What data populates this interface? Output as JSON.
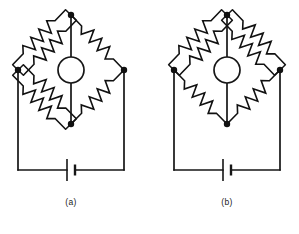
{
  "figure": {
    "kind": "circuit-diagram",
    "line_color": "#161616",
    "background_color": "#ffffff",
    "panel_count": 2
  },
  "panels": [
    {
      "id": "panel-a",
      "caption": "(a)",
      "caption_x": 71,
      "caption_y": 205,
      "origin_x": 0,
      "bridge": {
        "top_node": {
          "x": 71,
          "y": 15
        },
        "left_node": {
          "x": 18,
          "y": 70
        },
        "right_node": {
          "x": 124,
          "y": 70
        },
        "bottom_node": {
          "x": 71,
          "y": 124
        },
        "galvanometer": {
          "cx": 71,
          "cy": 70,
          "r": 13,
          "label": ""
        },
        "arms": [
          {
            "name": "upper-left",
            "resistor_count": 2
          },
          {
            "name": "upper-right",
            "resistor_count": 1
          },
          {
            "name": "lower-left",
            "resistor_count": 2
          },
          {
            "name": "lower-right",
            "resistor_count": 1
          }
        ]
      },
      "supply": {
        "rail_y": 170,
        "left_rail_x": 18,
        "right_rail_x": 124,
        "battery": {
          "x": 71,
          "y": 170,
          "long_plate_height": 22,
          "short_plate_height": 11
        }
      }
    },
    {
      "id": "panel-b",
      "caption": "(b)",
      "caption_x": 227,
      "caption_y": 205,
      "origin_x": 156,
      "bridge": {
        "top_node": {
          "x": 227,
          "y": 15
        },
        "left_node": {
          "x": 174,
          "y": 70
        },
        "right_node": {
          "x": 280,
          "y": 70
        },
        "bottom_node": {
          "x": 227,
          "y": 124
        },
        "galvanometer": {
          "cx": 227,
          "cy": 70,
          "r": 13,
          "label": ""
        },
        "arms": [
          {
            "name": "upper-left",
            "resistor_count": 2
          },
          {
            "name": "upper-right",
            "resistor_count": 2
          },
          {
            "name": "lower-left",
            "resistor_count": 1
          },
          {
            "name": "lower-right",
            "resistor_count": 1
          }
        ]
      },
      "supply": {
        "rail_y": 170,
        "left_rail_x": 174,
        "right_rail_x": 280,
        "battery": {
          "x": 227,
          "y": 170,
          "long_plate_height": 22,
          "short_plate_height": 11
        }
      }
    }
  ]
}
